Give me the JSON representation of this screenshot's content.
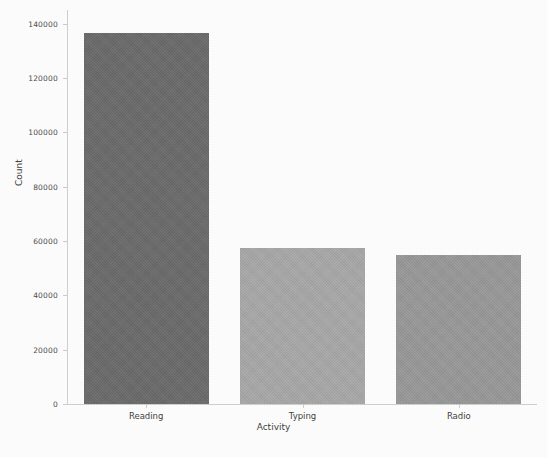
{
  "figure": {
    "width": 547,
    "height": 457,
    "background_color": "#fdfdfd"
  },
  "chart_data": {
    "type": "bar",
    "title": "",
    "categories": [
      "Reading",
      "Typing",
      "Radio"
    ],
    "values": [
      136500,
      57500,
      55000
    ],
    "xlabel": "Activity",
    "ylabel": "Count",
    "ylim": [
      0,
      145000
    ],
    "yticks": [
      0,
      20000,
      40000,
      60000,
      80000,
      100000,
      120000,
      140000
    ],
    "ytick_labels": [
      "0",
      "20000",
      "40000",
      "60000",
      "80000",
      "100000",
      "120000",
      "140000"
    ],
    "grid": false,
    "legend": null,
    "bar_colors": [
      "#6b6b6b",
      "#a9a9a9",
      "#999999"
    ],
    "bars": [
      {
        "category": "Reading",
        "value": 136500,
        "color": "#6b6b6b"
      },
      {
        "category": "Typing",
        "value": 57500,
        "color": "#a9a9a9"
      },
      {
        "category": "Radio",
        "value": 55000,
        "color": "#999999"
      }
    ]
  },
  "axes": {
    "spine_color": "#cfcfcf",
    "tick_color": "#cbcbcb",
    "label_color": "#3f3f3f"
  }
}
